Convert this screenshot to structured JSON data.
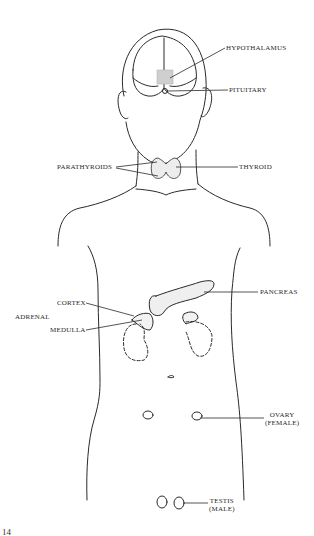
{
  "diagram": {
    "colors": {
      "ink": "#2a2a2a",
      "background": "#ffffff",
      "gland_fill": "#d8d8d8"
    },
    "labels": {
      "hypothalamus": "HYPOTHALAMUS",
      "pituitary": "PITUITARY",
      "parathyroids": "PARATHYROIDS",
      "thyroid": "THYROID",
      "pancreas": "PANCREAS",
      "adrenal": "ADRENAL",
      "cortex": "CORTEX",
      "medulla": "MEDULLA",
      "ovary": "OVARY",
      "ovary_sub": "(FEMALE)",
      "testis": "TESTIS",
      "testis_sub": "(MALE)"
    },
    "page_number": "14"
  }
}
